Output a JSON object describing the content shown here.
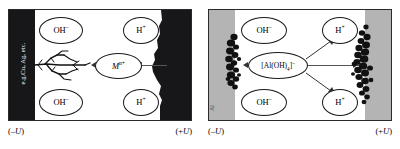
{
  "figure": {
    "type": "electrochemical-cell-diagram",
    "panel_count": 2,
    "colors": {
      "electrode_dark": "#17171a",
      "electrode_gray": "#b4b4b4",
      "deposit": "#111111",
      "frame": "#2a2a2a",
      "background": "#ffffff",
      "arrow": "#333333"
    }
  },
  "panels": [
    {
      "id": "left",
      "name": "metal-dendrite-panel",
      "cathode": {
        "name": "cathode-dark",
        "label": "e.g.Cu, Ag, etc.",
        "fill": "#17171a",
        "potential_label": "(–U)"
      },
      "anode": {
        "name": "anode-dark",
        "label": "",
        "fill": "#17171a",
        "potential_label": "(+U)"
      },
      "bubbles": [
        {
          "id": "oh-top",
          "text": "OH",
          "charge": "–",
          "side": "cathode"
        },
        {
          "id": "oh-bottom",
          "text": "OH",
          "charge": "–",
          "side": "cathode"
        },
        {
          "id": "h-top",
          "text": "H",
          "charge": "+",
          "side": "anode"
        },
        {
          "id": "h-bottom",
          "text": "H",
          "charge": "+",
          "side": "anode"
        },
        {
          "id": "mion",
          "text": "M",
          "charge": "n+",
          "side": "center"
        }
      ],
      "migrating_species": {
        "symbol": "M",
        "charge": "n+"
      },
      "deposit_type": "dendritic-branches",
      "arrows": [
        {
          "id": "arrow-to-cathode",
          "direction": "left"
        },
        {
          "id": "arrow-from-anode",
          "direction": "left"
        }
      ]
    },
    {
      "id": "right",
      "name": "aluminate-panel",
      "cathode": {
        "name": "cathode-aluminium",
        "label": "Al",
        "fill": "#b4b4b4",
        "potential_label": "(–U)"
      },
      "anode": {
        "name": "anode-aluminium",
        "label": "",
        "fill": "#b4b4b4",
        "potential_label": "(+U)"
      },
      "bubbles": [
        {
          "id": "oh-top",
          "text": "OH",
          "charge": "–",
          "side": "cathode"
        },
        {
          "id": "oh-bottom",
          "text": "OH",
          "charge": "–",
          "side": "cathode"
        },
        {
          "id": "h-top",
          "text": "H",
          "charge": "+",
          "side": "anode"
        },
        {
          "id": "h-bottom",
          "text": "H",
          "charge": "+",
          "side": "anode"
        },
        {
          "id": "aluminate",
          "text": "[Al(OH)",
          "subscript": "4",
          "closing": "]",
          "charge": "–",
          "side": "center"
        }
      ],
      "migrating_species": {
        "symbol": "[Al(OH)4]",
        "charge": "–"
      },
      "deposit_type": "clustered-granular",
      "arrows": [
        {
          "id": "arrow-to-cathode",
          "direction": "left"
        },
        {
          "id": "arrow-from-anode",
          "direction": "left"
        },
        {
          "id": "arrow-diag-up",
          "direction": "up-right"
        },
        {
          "id": "arrow-diag-down",
          "direction": "down-right"
        }
      ]
    }
  ],
  "labels": {
    "negative_potential": "(–U)",
    "positive_potential": "(+U)",
    "cathode_material_left": "e.g.Cu, Ag, etc.",
    "cathode_material_right": "Al",
    "hydroxide": "OH",
    "hydroxide_charge": "–",
    "proton": "H",
    "proton_charge": "+",
    "metal_ion": "M",
    "metal_ion_charge": "n+",
    "aluminate_open": "[Al(OH)",
    "aluminate_sub": "4",
    "aluminate_close": "]",
    "aluminate_charge": "–",
    "u_symbol": "U"
  }
}
